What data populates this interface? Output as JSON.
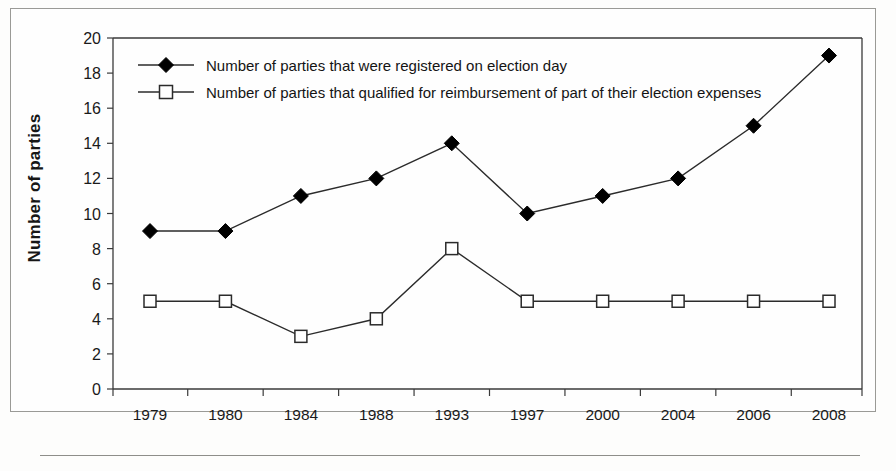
{
  "chart_data": {
    "type": "line",
    "title": "",
    "xlabel": "",
    "ylabel": "Number of parties",
    "categories": [
      "1979",
      "1980",
      "1984",
      "1988",
      "1993",
      "1997",
      "2000",
      "2004",
      "2006",
      "2008"
    ],
    "series": [
      {
        "name": "Number of parties that were registered on election day",
        "marker": "filled-diamond",
        "values": [
          9,
          9,
          11,
          12,
          14,
          10,
          11,
          12,
          15,
          19
        ]
      },
      {
        "name": "Number of parties that qualified for reimbursement of part of their election expenses",
        "marker": "open-square",
        "values": [
          5,
          5,
          3,
          4,
          8,
          5,
          5,
          5,
          5,
          5
        ]
      }
    ],
    "ylim": [
      0,
      20
    ],
    "ytick_step": 2,
    "yticks": [
      "0",
      "2",
      "4",
      "6",
      "8",
      "10",
      "12",
      "14",
      "16",
      "18",
      "20"
    ],
    "grid": false,
    "legend_position": "top-left",
    "colors": {
      "line": "#2b2b2b",
      "diamond_fill": "#000000",
      "square_fill": "#ffffff",
      "axis": "#3a3a3a",
      "text": "#1a1a1a",
      "frame": "#9a9a96",
      "background": "#fefefe"
    }
  }
}
